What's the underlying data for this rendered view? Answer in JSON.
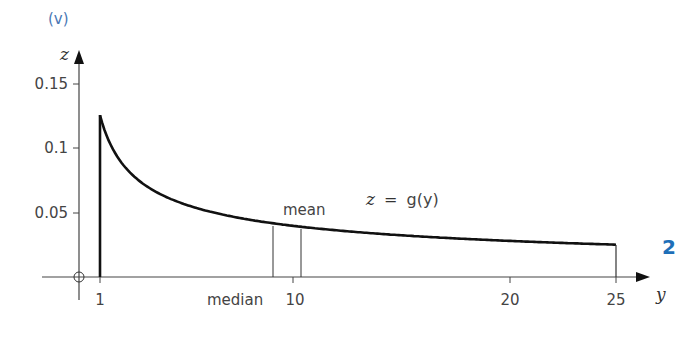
{
  "part_label": "(v)",
  "question_number": "2",
  "chart_data": {
    "type": "line",
    "title": "",
    "function_label_lhs": "z",
    "function_label_eq": "=",
    "function_label_rhs": "g(y)",
    "xlabel": "y",
    "ylabel": "z",
    "origin_label": "O",
    "x_ticks": [
      {
        "value": 1,
        "label": "1"
      },
      {
        "value": 10,
        "label": "10"
      },
      {
        "value": 20,
        "label": "20"
      },
      {
        "value": 25,
        "label": "25"
      }
    ],
    "y_ticks": [
      {
        "value": 0.05,
        "label": "0.05"
      },
      {
        "value": 0.1,
        "label": "0.1"
      },
      {
        "value": 0.15,
        "label": "0.15"
      }
    ],
    "xlim": [
      0,
      26
    ],
    "ylim": [
      0,
      0.16
    ],
    "domain": [
      1,
      25
    ],
    "series": [
      {
        "name": "z = g(y)",
        "formula": "1/(8*sqrt(y))",
        "x": [
          1,
          2,
          3,
          4,
          5,
          6,
          8,
          10,
          12,
          15,
          18,
          20,
          22,
          25
        ],
        "values": [
          0.125,
          0.088,
          0.072,
          0.0625,
          0.056,
          0.051,
          0.044,
          0.04,
          0.036,
          0.032,
          0.029,
          0.028,
          0.027,
          0.025
        ]
      }
    ],
    "annotations": [
      {
        "label": "median",
        "x": 9.0
      },
      {
        "label": "mean",
        "x": 10.33
      }
    ],
    "grid": false,
    "legend": "none"
  }
}
